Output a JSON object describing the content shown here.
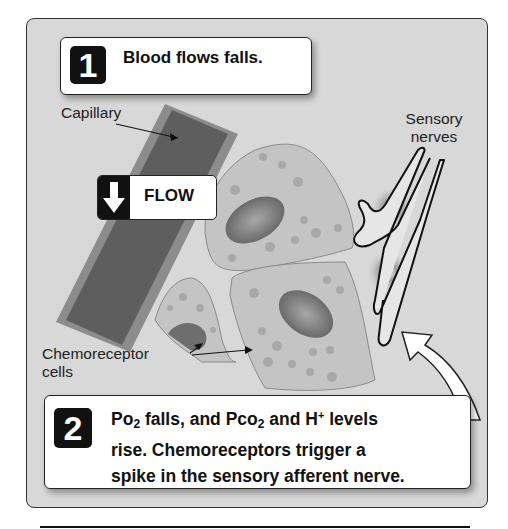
{
  "diagram": {
    "colors": {
      "background": "#d8d8d8",
      "capillary_outer": "#8c8c8c",
      "capillary_inner": "#5e5e5e",
      "cell_fill": "#c4c4c4",
      "nucleus": "#7a7a7a",
      "step_badge": "#111111",
      "callout_fill": "#ffffff"
    },
    "steps": [
      {
        "number": "1",
        "text": "Blood flows falls."
      },
      {
        "number": "2",
        "line1_a": "Po",
        "line1_sub1": "2",
        "line1_b": " falls, and Pco",
        "line1_sub2": "2",
        "line1_c": " and H",
        "line1_sup": "+",
        "line1_d": " levels",
        "line2": "rise. Chemoreceptors trigger a",
        "line3": "spike in the sensory afferent nerve."
      }
    ],
    "flow_indicator": {
      "icon": "arrow-down-icon",
      "label": "FLOW"
    },
    "labels": {
      "capillary": "Capillary",
      "sensory_line1": "Sensory",
      "sensory_line2": "nerves",
      "chemo_line1": "Chemoreceptor",
      "chemo_line2": "cells"
    }
  }
}
